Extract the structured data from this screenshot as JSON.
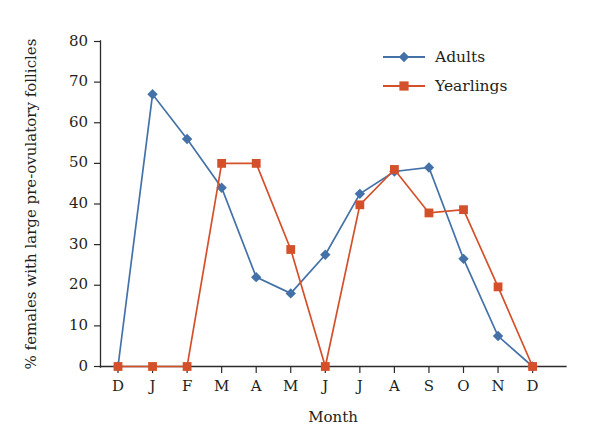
{
  "chart_data": {
    "type": "line",
    "title": "",
    "subtitle": "",
    "xlabel": "Month",
    "ylabel": "% females with large pre-ovulatory follicles",
    "categories": [
      "D",
      "J",
      "F",
      "M",
      "A",
      "M",
      "J",
      "J",
      "A",
      "S",
      "O",
      "N",
      "D"
    ],
    "x_tick_labels": [
      "D",
      "J",
      "F",
      "M",
      "A",
      "M",
      "J",
      "J",
      "A",
      "S",
      "O",
      "N",
      "D"
    ],
    "y_tick_labels": [
      "0",
      "10",
      "20",
      "30",
      "40",
      "50",
      "60",
      "70",
      "80"
    ],
    "y_ticks": [
      0,
      10,
      20,
      30,
      40,
      50,
      60,
      70,
      80
    ],
    "ylim": [
      0,
      80
    ],
    "grid": false,
    "legend_position": "top-right",
    "series": [
      {
        "name": "Adults",
        "color": "#4472a8",
        "marker": "diamond",
        "values": [
          0,
          67,
          56,
          44,
          22,
          18,
          27.5,
          42.5,
          48,
          49,
          26.5,
          7.5,
          0
        ]
      },
      {
        "name": "Yearlings",
        "color": "#d4502a",
        "marker": "square",
        "values": [
          0,
          0,
          0,
          50,
          50,
          28.8,
          0,
          39.8,
          48.5,
          37.8,
          38.6,
          19.6,
          0
        ]
      }
    ]
  },
  "legend": {
    "entries": [
      {
        "label": "Adults"
      },
      {
        "label": "Yearlings"
      }
    ]
  },
  "colors": {
    "adults": "#4472a8",
    "yearlings": "#d4502a",
    "axis": "#2b2b2b",
    "text": "#231f20",
    "background": "#ffffff"
  }
}
